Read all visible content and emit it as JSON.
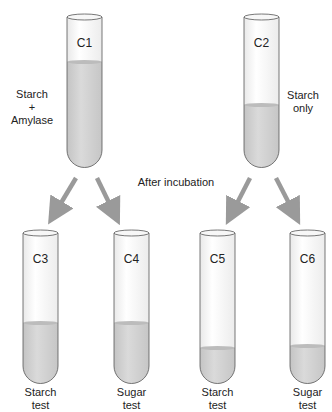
{
  "colors": {
    "liquid": "#cfcfcf",
    "liquid_top": "#bdbdbd",
    "glass_outline": "#555555",
    "arrow": "#9a9a9a",
    "text": "#222222"
  },
  "labels": {
    "after_incubation": "After incubation"
  },
  "tubes": [
    {
      "id": "C1",
      "side_label_line1": "Starch",
      "side_label_line2": "+",
      "side_label_line3": "Amylase",
      "fill": "high"
    },
    {
      "id": "C2",
      "side_label_line1": "Starch",
      "side_label_line2": "only",
      "fill": "medium"
    },
    {
      "id": "C3",
      "caption_line1": "Starch",
      "caption_line2": "test",
      "fill": "medium"
    },
    {
      "id": "C4",
      "caption_line1": "Sugar",
      "caption_line2": "test",
      "fill": "medium"
    },
    {
      "id": "C5",
      "caption_line1": "Starch",
      "caption_line2": "test",
      "fill": "low"
    },
    {
      "id": "C6",
      "caption_line1": "Sugar",
      "caption_line2": "test",
      "fill": "low"
    }
  ],
  "arrows": [
    {
      "from": "C1",
      "to": "C3"
    },
    {
      "from": "C1",
      "to": "C4"
    },
    {
      "from": "C2",
      "to": "C5"
    },
    {
      "from": "C2",
      "to": "C6"
    }
  ]
}
